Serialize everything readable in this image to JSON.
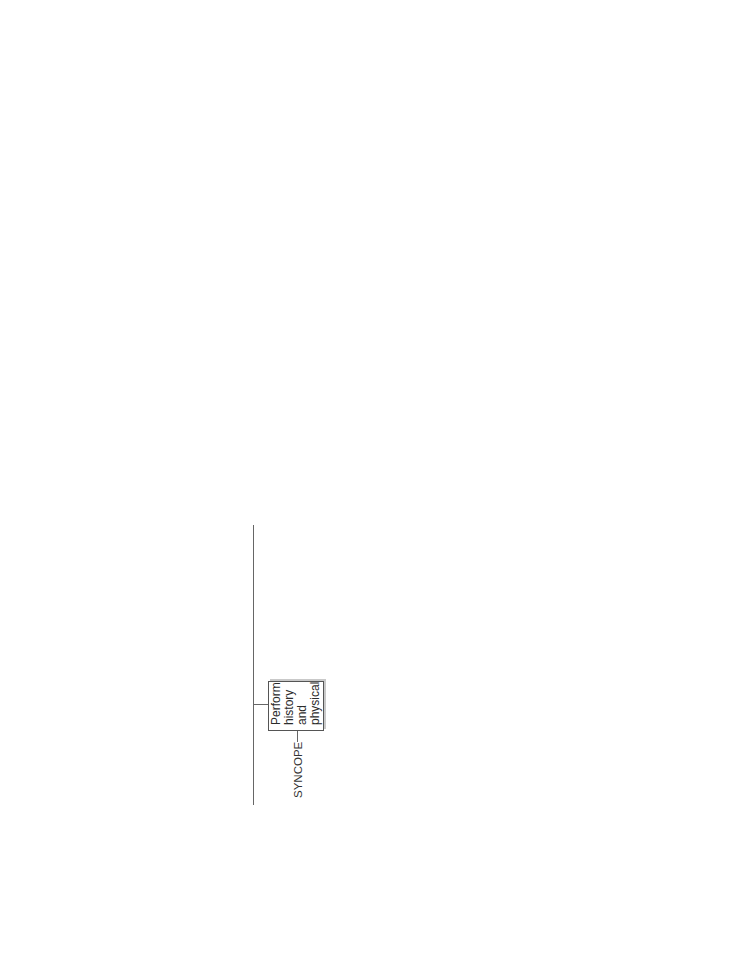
{
  "root": "SYNCOPE",
  "nodes": {
    "history_physical": "Perform\nhistory\nand\nphysical",
    "hp_abnormal": "H&P\nabnormal",
    "hp_normal": "H&P\nnormal",
    "check_hct": "Check\nHct",
    "hct_decreased": "Hct\ndecreased",
    "hct_normal": "Hct\nnormal\nor\nincreased",
    "check_electrolytes": "Check\nelectrolytes,\nBUN, glucose",
    "electrolytes_abnormal": "Electrolytes\nabnormal",
    "electrolytes_normal": "Electrolytes\nnormal",
    "perform_vq": "Perform\nV/Q\nscan",
    "vq_positive": "V/Q scan\npositive",
    "vq_negative": "V/Q scan\nnegative",
    "perform_echo": "Perform\nechocardiogram",
    "echo_abnormal": "Echo\nabnormal",
    "echo_normal": "Echo\nnormal",
    "cardiac_monitoring": "Perform\ncardiac\nmonitoring",
    "rhythm_abnormal": "Rhythm\nabnormal",
    "rhythm_normal": "Rhythm\nnormal",
    "perform_eeg": "Perform\nEEG",
    "seizure_activity": "Seizure\nactivity",
    "no_seizure": "No\nseizure\nactivity",
    "brain_imaging": "Perform\nbrain\nimaging",
    "imaging_abnormal": "Imaging\nabnormal",
    "imaging_normal": "Imaging\nnormal",
    "carotid_massage": "Perform\ncarotid\nsinus\nmassage",
    "positive_response": "Positive\nresponse",
    "negative_response": "Negative\nresponse"
  },
  "findings": {
    "orthostatic": "Orthostatic BP changes",
    "neurologic": "Associated\nneurologic\nsymptoms",
    "dyspnea": "Dyspnea"
  },
  "outcomes": {
    "blood_loss": "Blood loss",
    "electrolytes_abnormal": [
      "Hypoglycemia",
      "Adrenal insufficiency",
      "Dehydration"
    ],
    "electrolytes_normal": [
      "Neurogenic syncope",
      "Prolonged recumbency",
      "Drug-induced syncope"
    ],
    "neurogenic": [
      "Idiopathic postural hypotension",
      "Shy-Drager syndrome",
      "Peripheral neuropathy",
      "Postsympathectomy",
      "Spinal cord disease"
    ],
    "neurologic": [
      "Stroke",
      "Subclavian steal syndrome",
      "Cerebral vasculitis",
      "Transient ischemic attack (TIA)"
    ],
    "pulmonary_embolus": "Pulmonary embolus",
    "echo_abnormal": [
      "Pulmonic stenosis",
      "Aortic stenosis",
      "Septal hypertrophy (IHSS)",
      "Mitral stenosis",
      "Myocardial infarcation",
      "Pericardial tamponade"
    ],
    "hyperventilation": "Hyperventilation",
    "dysrhythmia": "Dysrhythmia",
    "imaging_abnormal": [
      "Mass lesion",
      "Hematoma",
      "A-V malformation"
    ],
    "epilepsy": "Epilepsy",
    "carotid_sinus": "Carotid sinus syncope",
    "negative_response": [
      "Vasovagal syncope",
      "Situational syncope",
      "Idiopathic syncope"
    ]
  },
  "citation": {
    "prefix": "(Modified from Healey P, Jacobson E. ",
    "title": "Common Medical Diagnoses: An Algorithmic Approach,",
    "suffix": " ed 3. Philadelphia, WB Saunders, 2000.)"
  }
}
